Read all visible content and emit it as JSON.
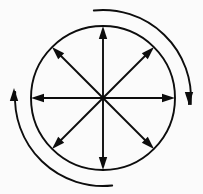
{
  "figure": {
    "background_color": "#fbfbfb",
    "stroke_color": "#0d0d0d",
    "canvas": {
      "width": 203,
      "height": 194
    }
  },
  "chart_data": {
    "type": "diagram",
    "xlabel": "",
    "ylabel": "",
    "center": {
      "x": 103,
      "y": 98
    },
    "circle": {
      "name": "inner-circle",
      "radius": 72,
      "stroke_width": 1.9,
      "fill": "none"
    },
    "radial_arrows": [
      {
        "name": "arrow-north",
        "angle_deg": 90,
        "label": "N",
        "tip": {
          "x": 103,
          "y": 26
        },
        "direction": "outward"
      },
      {
        "name": "arrow-northeast",
        "angle_deg": 45,
        "label": "NE",
        "tip": {
          "x": 154,
          "y": 47
        },
        "direction": "outward"
      },
      {
        "name": "arrow-east",
        "angle_deg": 0,
        "label": "E",
        "tip": {
          "x": 175,
          "y": 98
        },
        "direction": "outward"
      },
      {
        "name": "arrow-southeast",
        "angle_deg": -45,
        "label": "SE",
        "tip": {
          "x": 154,
          "y": 149
        },
        "direction": "outward"
      },
      {
        "name": "arrow-south",
        "angle_deg": -90,
        "label": "S",
        "tip": {
          "x": 103,
          "y": 170
        },
        "direction": "outward"
      },
      {
        "name": "arrow-southwest",
        "angle_deg": -135,
        "label": "SW",
        "tip": {
          "x": 52,
          "y": 149
        },
        "direction": "outward"
      },
      {
        "name": "arrow-west",
        "angle_deg": 180,
        "label": "W",
        "tip": {
          "x": 31,
          "y": 98
        },
        "direction": "outward"
      },
      {
        "name": "arrow-northwest",
        "angle_deg": 135,
        "label": "NW",
        "tip": {
          "x": 52,
          "y": 47
        },
        "direction": "outward"
      }
    ],
    "outer_arcs": [
      {
        "name": "arc-clockwise-right",
        "radius": 88,
        "start_angle_deg": 96,
        "end_angle_deg": -4,
        "sweep": "clockwise",
        "arrowhead": {
          "at": "end",
          "points": "down",
          "x": 189,
          "y": 105
        },
        "stroke_width": 1.9
      },
      {
        "name": "arc-counterclockwise-left",
        "radius": 88,
        "start_angle_deg": -84,
        "end_angle_deg": -184,
        "sweep": "clockwise",
        "arrowhead": {
          "at": "end",
          "points": "up",
          "x": 14,
          "y": 88
        },
        "stroke_width": 1.9
      }
    ],
    "arrowhead_style": {
      "shape": "solid-triangle",
      "length": 13,
      "half_width": 4.2
    },
    "legend": [],
    "annotations": [],
    "grid": false
  }
}
